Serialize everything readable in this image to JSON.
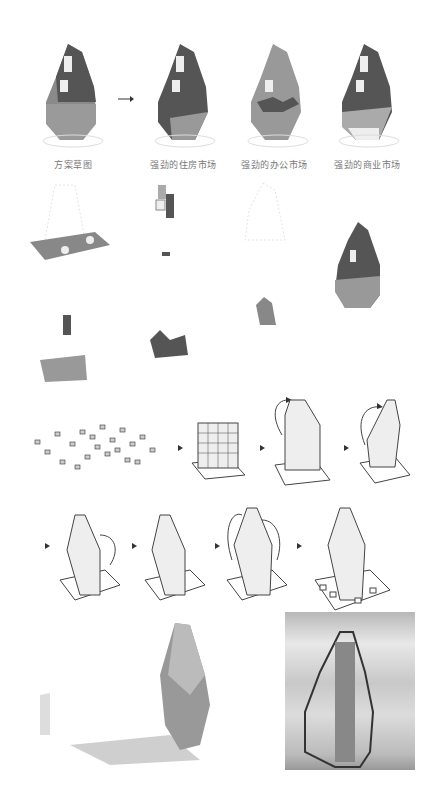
{
  "figure": {
    "row1": {
      "labels": [
        "方案草图",
        "强劲的住房市场",
        "强劲的办公市场",
        "强劲的商业市场"
      ],
      "arrow": "right-arrow"
    },
    "colors": {
      "dark": "#555555",
      "mid": "#8a8a8a",
      "light": "#b5b5b5",
      "white": "#f2f2f2",
      "line": "#444444"
    },
    "sequence": {
      "row1_steps": 4,
      "row2_steps": 4
    }
  }
}
